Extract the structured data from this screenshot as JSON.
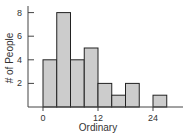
{
  "chart_data": {
    "type": "bar",
    "title": "",
    "xlabel": "Ordinary",
    "ylabel": "# of People",
    "bin_width": 3,
    "bins": [
      {
        "start": 0,
        "end": 3,
        "count": 4
      },
      {
        "start": 3,
        "end": 6,
        "count": 8
      },
      {
        "start": 6,
        "end": 9,
        "count": 4
      },
      {
        "start": 9,
        "end": 12,
        "count": 5
      },
      {
        "start": 12,
        "end": 15,
        "count": 2
      },
      {
        "start": 15,
        "end": 18,
        "count": 1
      },
      {
        "start": 18,
        "end": 21,
        "count": 2
      },
      {
        "start": 21,
        "end": 24,
        "count": 0
      },
      {
        "start": 24,
        "end": 27,
        "count": 1
      }
    ],
    "x_ticks": [
      0,
      12,
      24
    ],
    "y_ticks": [
      2,
      4,
      6,
      8
    ],
    "xlim": [
      -3,
      30
    ],
    "ylim": [
      0,
      8.5
    ],
    "grid": false,
    "legend": null,
    "colors": {
      "bar_fill": "#cccccc",
      "bar_stroke": "#222222",
      "axis": "#444444"
    }
  }
}
